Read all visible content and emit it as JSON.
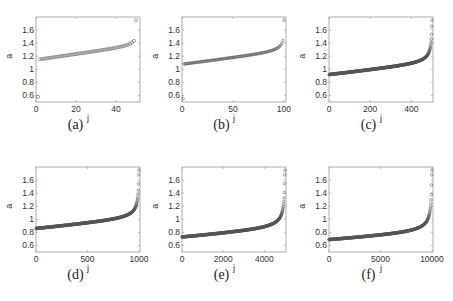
{
  "chart_data": [
    {
      "panel": "a",
      "caption": "(a)",
      "type": "scatter",
      "xlabel": "j",
      "ylabel": "a_j",
      "xlim": [
        0,
        52
      ],
      "ylim": [
        0.5,
        1.8
      ],
      "xticks": [
        0,
        20,
        40
      ],
      "yticks": [
        0.6,
        0.8,
        1,
        1.2,
        1.4,
        1.6
      ],
      "n": 50,
      "start": 1.15,
      "mid": 1.25,
      "end_before": 1.55,
      "first": 0.58,
      "last": 1.75,
      "marker": "open-circle",
      "grid": false
    },
    {
      "panel": "b",
      "caption": "(b)",
      "type": "scatter",
      "xlabel": "j",
      "ylabel": "a_j",
      "xlim": [
        0,
        102
      ],
      "ylim": [
        0.5,
        1.8
      ],
      "xticks": [
        0,
        50,
        100
      ],
      "yticks": [
        0.6,
        0.8,
        1,
        1.2,
        1.4,
        1.6
      ],
      "n": 100,
      "start": 1.08,
      "mid": 1.17,
      "end_before": 1.6,
      "first": 0.55,
      "last": 1.75,
      "marker": "open-circle",
      "grid": false
    },
    {
      "panel": "c",
      "caption": "(c)",
      "type": "scatter",
      "xlabel": "j",
      "ylabel": "a_j",
      "xlim": [
        0,
        505
      ],
      "ylim": [
        0.5,
        1.8
      ],
      "xticks": [
        0,
        200,
        400
      ],
      "yticks": [
        0.6,
        0.8,
        1,
        1.2,
        1.4,
        1.6
      ],
      "n": 500,
      "start": 0.92,
      "mid": 1.0,
      "end_before": 1.6,
      "first": 0.92,
      "last": 1.75,
      "marker": "open-circle",
      "grid": false
    },
    {
      "panel": "d",
      "caption": "(d)",
      "type": "scatter",
      "xlabel": "j",
      "ylabel": "a_j",
      "xlim": [
        0,
        1010
      ],
      "ylim": [
        0.5,
        1.8
      ],
      "xticks": [
        0,
        500,
        1000
      ],
      "yticks": [
        0.6,
        0.8,
        1,
        1.2,
        1.4,
        1.6
      ],
      "n": 1000,
      "start": 0.86,
      "mid": 0.93,
      "end_before": 1.6,
      "first": 0.86,
      "last": 1.75,
      "marker": "open-circle",
      "grid": false
    },
    {
      "panel": "e",
      "caption": "(e)",
      "type": "scatter",
      "xlabel": "j",
      "ylabel": "a_j",
      "xlim": [
        0,
        5050
      ],
      "ylim": [
        0.5,
        1.8
      ],
      "xticks": [
        0,
        2000,
        4000
      ],
      "yticks": [
        0.6,
        0.8,
        1,
        1.2,
        1.4,
        1.6
      ],
      "n": 5000,
      "start": 0.73,
      "mid": 0.79,
      "end_before": 1.6,
      "first": 0.73,
      "last": 1.75,
      "marker": "open-circle",
      "grid": false
    },
    {
      "panel": "f",
      "caption": "(f)",
      "type": "scatter",
      "xlabel": "j",
      "ylabel": "a_j",
      "xlim": [
        0,
        10100
      ],
      "ylim": [
        0.5,
        1.8
      ],
      "xticks": [
        0,
        5000,
        10000
      ],
      "yticks": [
        0.6,
        0.8,
        1,
        1.2,
        1.4,
        1.6
      ],
      "n": 10000,
      "start": 0.69,
      "mid": 0.74,
      "end_before": 1.6,
      "first": 0.69,
      "last": 1.75,
      "marker": "open-circle",
      "grid": false
    }
  ],
  "captions": [
    "(a)",
    "(b)",
    "(c)",
    "(d)",
    "(e)",
    "(f)"
  ]
}
